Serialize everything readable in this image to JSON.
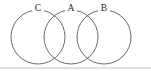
{
  "figure": {
    "name": "three-overlapping-circles",
    "type": "venn-chain-diagram",
    "width": 151,
    "height": 71,
    "background_color": "#ffffff",
    "stroke_color": "#5a5a5a",
    "label_color": "#2b2b2b",
    "baseline_color": "#b9b9b9"
  },
  "circles": [
    {
      "id": "circle-c",
      "label": "C",
      "cx": 38,
      "cy": 37,
      "r": 27
    },
    {
      "id": "circle-a",
      "label": "A",
      "cx": 71,
      "cy": 37,
      "r": 27
    },
    {
      "id": "circle-b",
      "label": "B",
      "cx": 104,
      "cy": 37,
      "r": 27
    }
  ],
  "labels": [
    {
      "id": "label-c",
      "text": "C",
      "x": 38,
      "y": 9
    },
    {
      "id": "label-a",
      "text": "A",
      "x": 71,
      "y": 9
    },
    {
      "id": "label-b",
      "text": "B",
      "x": 104,
      "y": 9
    }
  ],
  "intersections": [
    {
      "id": "intersection-c-a-top",
      "x": 60,
      "y": 13
    },
    {
      "id": "intersection-c-a-bottom",
      "x": 60,
      "y": 60
    },
    {
      "id": "intersection-a-b-top",
      "x": 93,
      "y": 13
    },
    {
      "id": "intersection-a-b-bottom",
      "x": 93,
      "y": 60
    }
  ],
  "baseline": {
    "id": "baseline-rule",
    "x1": 0,
    "y1": 68,
    "x2": 151,
    "y2": 68
  }
}
